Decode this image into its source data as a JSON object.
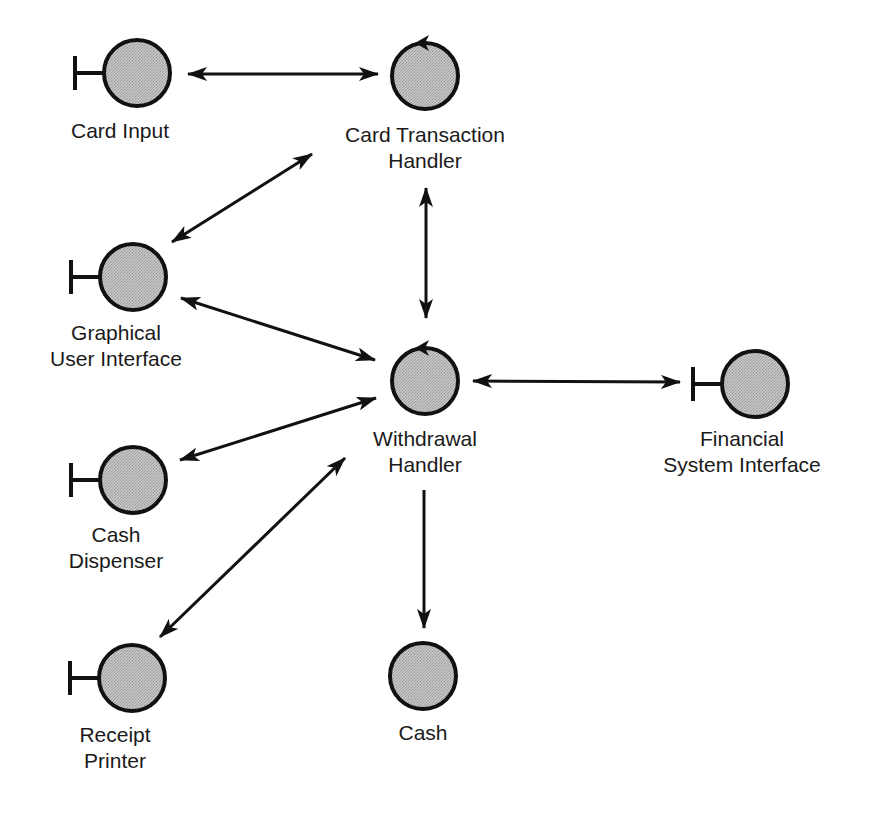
{
  "diagram": {
    "type": "communication diagram",
    "colors": {
      "node_fill": "#bdbdbd",
      "stroke": "#111111",
      "background": "#ffffff"
    },
    "nodes": [
      {
        "id": "card_input",
        "kind": "boundary",
        "cx": 137,
        "cy": 73,
        "label_lines": [
          "Card Input"
        ],
        "label_x": 120,
        "label_y": 118
      },
      {
        "id": "card_transaction_handler",
        "kind": "control",
        "cx": 425,
        "cy": 76,
        "label_lines": [
          "Card Transaction",
          "Handler"
        ],
        "label_x": 425,
        "label_y": 122
      },
      {
        "id": "graphical_user_interface",
        "kind": "boundary",
        "cx": 133,
        "cy": 277,
        "label_lines": [
          "Graphical",
          "User Interface"
        ],
        "label_x": 116,
        "label_y": 320
      },
      {
        "id": "withdrawal_handler",
        "kind": "control",
        "cx": 425,
        "cy": 381,
        "label_lines": [
          "Withdrawal",
          "Handler"
        ],
        "label_x": 425,
        "label_y": 426
      },
      {
        "id": "financial_system_interface",
        "kind": "boundary",
        "cx": 755,
        "cy": 384,
        "label_lines": [
          "Financial",
          "System Interface"
        ],
        "label_x": 742,
        "label_y": 426
      },
      {
        "id": "cash_dispenser",
        "kind": "boundary",
        "cx": 133,
        "cy": 480,
        "label_lines": [
          "Cash",
          "Dispenser"
        ],
        "label_x": 116,
        "label_y": 522
      },
      {
        "id": "receipt_printer",
        "kind": "boundary",
        "cx": 132,
        "cy": 678,
        "label_lines": [
          "Receipt",
          "Printer"
        ],
        "label_x": 115,
        "label_y": 722
      },
      {
        "id": "cash",
        "kind": "entity",
        "cx": 423,
        "cy": 676,
        "label_lines": [
          "Cash"
        ],
        "label_x": 423,
        "label_y": 720
      }
    ],
    "edges": [
      {
        "from": "card_input",
        "to": "card_transaction_handler",
        "direction": "both",
        "x1": 188,
        "y1": 74,
        "x2": 378,
        "y2": 74
      },
      {
        "from": "graphical_user_interface",
        "to": "card_transaction_handler",
        "direction": "both",
        "x1": 172,
        "y1": 242,
        "x2": 312,
        "y2": 154
      },
      {
        "from": "card_transaction_handler",
        "to": "withdrawal_handler",
        "direction": "both",
        "x1": 426,
        "y1": 188,
        "x2": 426,
        "y2": 318
      },
      {
        "from": "graphical_user_interface",
        "to": "withdrawal_handler",
        "direction": "both",
        "x1": 181,
        "y1": 298,
        "x2": 375,
        "y2": 360
      },
      {
        "from": "withdrawal_handler",
        "to": "financial_system_interface",
        "direction": "both",
        "x1": 473,
        "y1": 381,
        "x2": 680,
        "y2": 382
      },
      {
        "from": "cash_dispenser",
        "to": "withdrawal_handler",
        "direction": "both",
        "x1": 180,
        "y1": 460,
        "x2": 376,
        "y2": 398
      },
      {
        "from": "receipt_printer",
        "to": "withdrawal_handler",
        "direction": "both",
        "x1": 160,
        "y1": 637,
        "x2": 345,
        "y2": 458
      },
      {
        "from": "withdrawal_handler",
        "to": "cash",
        "direction": "forward",
        "x1": 424,
        "y1": 490,
        "x2": 424,
        "y2": 628
      }
    ]
  }
}
